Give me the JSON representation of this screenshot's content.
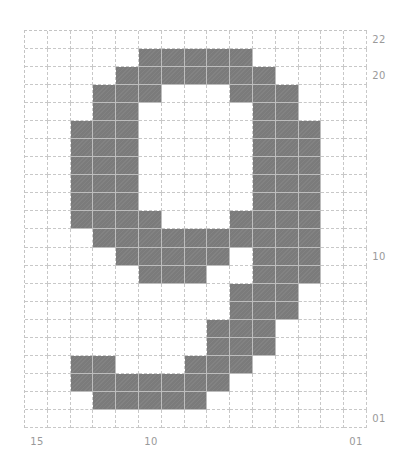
{
  "figure": {
    "columns": 15,
    "rows": 22,
    "colors": {
      "filled": "#7b7b7b",
      "empty": "#ffffff",
      "gridline": "#c8c8c8",
      "label": "#9a9a9a"
    },
    "filled_cells_by_row": [
      [],
      [
        5,
        6,
        7,
        8,
        9
      ],
      [
        4,
        5,
        6,
        7,
        8,
        9,
        10
      ],
      [
        3,
        4,
        5,
        9,
        10,
        11
      ],
      [
        3,
        4,
        10,
        11
      ],
      [
        2,
        3,
        4,
        10,
        11,
        12
      ],
      [
        2,
        3,
        4,
        10,
        11,
        12
      ],
      [
        2,
        3,
        4,
        10,
        11,
        12
      ],
      [
        2,
        3,
        4,
        10,
        11,
        12
      ],
      [
        2,
        3,
        4,
        10,
        11,
        12
      ],
      [
        2,
        3,
        4,
        5,
        9,
        10,
        11,
        12
      ],
      [
        3,
        4,
        5,
        6,
        7,
        8,
        9,
        10,
        11,
        12
      ],
      [
        4,
        5,
        6,
        7,
        8,
        10,
        11,
        12
      ],
      [
        5,
        6,
        7,
        10,
        11,
        12
      ],
      [
        9,
        10,
        11
      ],
      [
        9,
        10,
        11
      ],
      [
        8,
        9,
        10
      ],
      [
        8,
        9,
        10
      ],
      [
        2,
        3,
        7,
        8,
        9
      ],
      [
        2,
        3,
        4,
        5,
        6,
        7,
        8
      ],
      [
        3,
        4,
        5,
        6,
        7
      ],
      []
    ]
  },
  "axis_labels": {
    "right": [
      {
        "text": "22",
        "row": 0
      },
      {
        "text": "20",
        "row": 2
      },
      {
        "text": "10",
        "row": 12
      },
      {
        "text": "01",
        "row": 21
      }
    ],
    "bottom": [
      {
        "text": "15",
        "col": 0
      },
      {
        "text": "10",
        "col": 5
      },
      {
        "text": "01",
        "col": 14
      }
    ]
  }
}
